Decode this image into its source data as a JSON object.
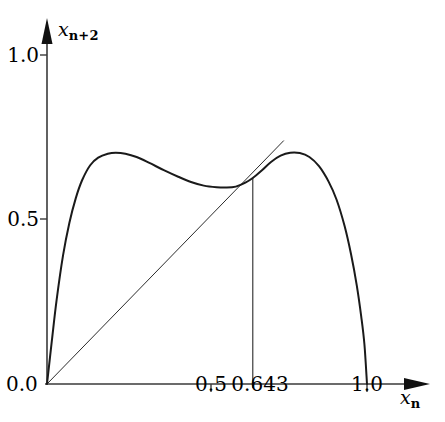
{
  "chart_data": {
    "type": "line",
    "title": "",
    "subtitle": "",
    "xlabel": "x_n",
    "ylabel": "x_n+2",
    "xlabel_base": "x",
    "xlabel_sub": "n",
    "ylabel_base": "x",
    "ylabel_sub": "n+2",
    "xlim": [
      0.0,
      1.12
    ],
    "ylim": [
      0.0,
      1.12
    ],
    "grid": false,
    "legend": null,
    "x_ticks": [
      "0.0",
      "0.5",
      "0.643",
      "1.0"
    ],
    "x_tick_values": [
      0.0,
      0.5,
      0.643,
      1.0
    ],
    "y_ticks": [
      "0.0",
      "0.5",
      "1.0"
    ],
    "y_tick_values": [
      0.0,
      0.5,
      1.0
    ],
    "annotations": [
      {
        "name": "fixed-point-dropline",
        "x": 0.643,
        "y_top": 0.626,
        "y_bottom": 0.0,
        "label": "0.643"
      }
    ],
    "series": [
      {
        "name": "second-iterate-map",
        "style": "solid",
        "width": 2.0,
        "color": "#1a1a1a",
        "points": [
          [
            0.0,
            0.0
          ],
          [
            0.015,
            0.13
          ],
          [
            0.03,
            0.255
          ],
          [
            0.05,
            0.39
          ],
          [
            0.07,
            0.49
          ],
          [
            0.09,
            0.565
          ],
          [
            0.11,
            0.62
          ],
          [
            0.135,
            0.665
          ],
          [
            0.16,
            0.688
          ],
          [
            0.19,
            0.7
          ],
          [
            0.215,
            0.703
          ],
          [
            0.245,
            0.7
          ],
          [
            0.28,
            0.69
          ],
          [
            0.32,
            0.672
          ],
          [
            0.365,
            0.65
          ],
          [
            0.41,
            0.63
          ],
          [
            0.45,
            0.614
          ],
          [
            0.49,
            0.603
          ],
          [
            0.53,
            0.598
          ],
          [
            0.56,
            0.597
          ],
          [
            0.59,
            0.6
          ],
          [
            0.62,
            0.612
          ],
          [
            0.643,
            0.626
          ],
          [
            0.67,
            0.648
          ],
          [
            0.7,
            0.675
          ],
          [
            0.73,
            0.694
          ],
          [
            0.76,
            0.703
          ],
          [
            0.79,
            0.702
          ],
          [
            0.82,
            0.69
          ],
          [
            0.85,
            0.662
          ],
          [
            0.88,
            0.615
          ],
          [
            0.905,
            0.56
          ],
          [
            0.93,
            0.48
          ],
          [
            0.95,
            0.395
          ],
          [
            0.968,
            0.3
          ],
          [
            0.982,
            0.205
          ],
          [
            0.992,
            0.12
          ],
          [
            1.0,
            0.0
          ]
        ]
      },
      {
        "name": "identity-line",
        "style": "solid",
        "width": 1.0,
        "color": "#2b2b2b",
        "description": "y = x diagonal",
        "points": [
          [
            0.0,
            0.0
          ],
          [
            0.74,
            0.74
          ]
        ]
      }
    ],
    "axis_arrows": {
      "x": true,
      "y": true
    }
  }
}
